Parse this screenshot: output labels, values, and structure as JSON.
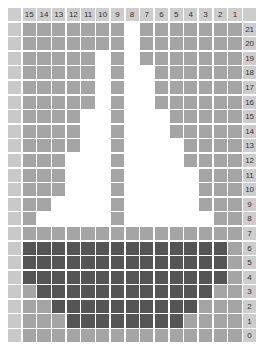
{
  "chart_data": {
    "type": "heatmap",
    "title": "",
    "column_labels": [
      "15",
      "14",
      "13",
      "12",
      "11",
      "10",
      "9",
      "8",
      "7",
      "6",
      "5",
      "4",
      "3",
      "2",
      "1"
    ],
    "row_labels": [
      "21",
      "20",
      "19",
      "18",
      "17",
      "16",
      "15",
      "14",
      "13",
      "12",
      "11",
      "10",
      "9",
      "8",
      "7",
      "6",
      "5",
      "4",
      "3",
      "2",
      "1",
      "0"
    ],
    "legend": {
      "W": "white (empty)",
      "M": "medium gray",
      "D": "dark gray"
    },
    "colors": {
      "W": "#ffffff",
      "M": "#a5a5a5",
      "D": "#555555",
      "label": "#cdcdcd"
    },
    "rows": [
      "MMMMMMMWMMMMMMM",
      "MMMMMMMWMMMMMMM",
      "MMMMMWMWMMMMMMM",
      "MMMMMWMWWMMMMMM",
      "MMMMMWMWWMMMMMM",
      "MMMMMWMWWMMMMMM",
      "MMMMWWMWWWMMMMM",
      "MMMMWWMWWWMMMMM",
      "MMMMWWMWWWWMMMM",
      "MMMWWWMWWWWMMMM",
      "MMMWWWMWWWWWMMM",
      "MMMWWWMWWWWWMMM",
      "MMWWWWMWWWWWMMM",
      "MWWWWWMWWWWWWMM",
      "MMMMMMMMMMMMMMM",
      "DDDDDDDDDDDDDDM",
      "DDDDDDDDDDDDDDM",
      "DDDDDDDDDDDDDDM",
      "MDDDDDDDDDDDDMM",
      "MMDDDDDDDDDDMMM",
      "MMMDDDDDDDDMMMM",
      "MMMMMMMMMMMMMMM"
    ]
  }
}
